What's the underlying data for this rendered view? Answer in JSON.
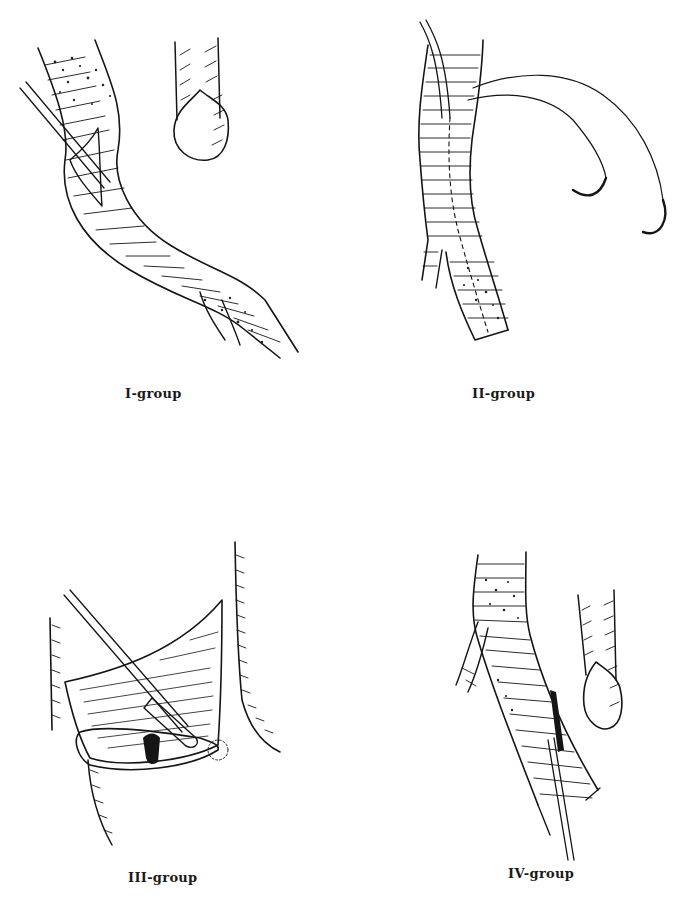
{
  "figure": {
    "background_color": "#ffffff",
    "ink_color": "#151515",
    "panels": [
      {
        "id": "I",
        "caption": "I-group",
        "depicts": "vessel with longitudinal incision, catheter inserted, and separate vessel end with open lumen"
      },
      {
        "id": "II",
        "caption": "II-group",
        "depicts": "bifurcating vessel with catheter and curved suture needles"
      },
      {
        "id": "III",
        "caption": "III-group",
        "depicts": "opened vessel flap with catheter tip inside lumen"
      },
      {
        "id": "IV",
        "caption": "IV-group",
        "depicts": "bifurcating vessel with catheter inserted from below and separate vessel end with open lumen"
      }
    ]
  }
}
